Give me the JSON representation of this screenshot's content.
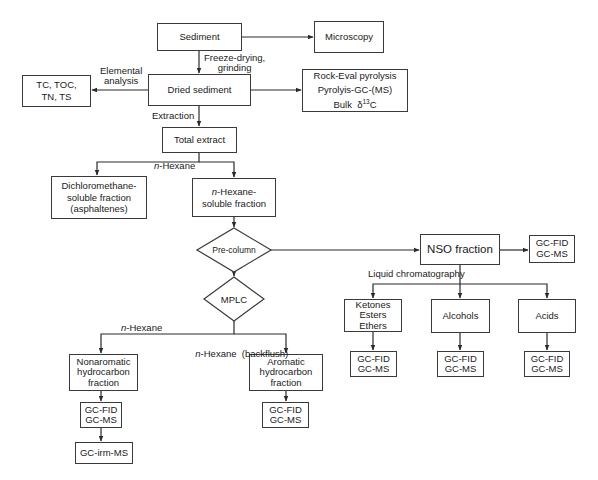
{
  "diagram": {
    "type": "flowchart",
    "nodes": {
      "sediment": {
        "label": "Sediment"
      },
      "microscopy": {
        "label": "Microscopy"
      },
      "dried_sediment": {
        "label": "Dried sediment"
      },
      "elemental_results": {
        "lines": [
          "TC, TOC,",
          "TN, TS"
        ]
      },
      "bulk_analyses": {
        "lines": [
          "Rock-Eval pyrolysis",
          "Pyrolyis-GC-(MS)"
        ],
        "bulk_prefix": "Bulk",
        "delta": "δ",
        "isotope": "13",
        "element": "C"
      },
      "total_extract": {
        "label": "Total extract"
      },
      "dcm_fraction": {
        "lines": [
          "Dichloromethane-",
          "soluble fraction",
          "(asphaltenes)"
        ]
      },
      "hexane_fraction": {
        "italic_prefix": "n",
        "line1_rest": "-Hexane-",
        "line2": "soluble fraction"
      },
      "precolumn": {
        "label": "Pre-column"
      },
      "nso_fraction": {
        "label": "NSO fraction"
      },
      "nso_gc": {
        "lines": [
          "GC-FID",
          "GC-MS"
        ]
      },
      "mplc": {
        "label": "MPLC"
      },
      "ketones": {
        "lines": [
          "Ketones",
          "Esters",
          "Ethers"
        ]
      },
      "alcohols": {
        "label": "Alcohols"
      },
      "acids": {
        "label": "Acids"
      },
      "ketones_gc": {
        "lines": [
          "GC-FID",
          "GC-MS"
        ]
      },
      "alcohols_gc": {
        "lines": [
          "GC-FID",
          "GC-MS"
        ]
      },
      "acids_gc": {
        "lines": [
          "GC-FID",
          "GC-MS"
        ]
      },
      "nonaromatic": {
        "lines": [
          "Nonaromatic",
          "hydrocarbon",
          "fraction"
        ]
      },
      "aromatic": {
        "lines": [
          "Aromatic",
          "hydrocarbon",
          "fraction"
        ]
      },
      "nonaromatic_gc": {
        "lines": [
          "GC-FID",
          "GC-MS"
        ]
      },
      "aromatic_gc": {
        "lines": [
          "GC-FID",
          "GC-MS"
        ]
      },
      "irm_ms": {
        "label": "GC-irm-MS"
      }
    },
    "edge_labels": {
      "freeze_drying": [
        "Freeze-drying,",
        "grinding"
      ],
      "elemental_analysis": [
        "Elemental",
        "analysis"
      ],
      "extraction": "Extraction",
      "hexane_split": {
        "italic": "n",
        "rest": "-Hexane"
      },
      "liquid_chromatography": "Liquid chromatography",
      "mplc_hexane": {
        "italic": "n",
        "rest": "-Hexane"
      },
      "mplc_backflush": {
        "italic": "n",
        "rest": "-Hexane  (backflush)"
      }
    },
    "colors": {
      "line": "#2a2a2a",
      "box_border": "#3a3a3a",
      "background": "#ffffff",
      "text": "#1a1a1a"
    }
  }
}
